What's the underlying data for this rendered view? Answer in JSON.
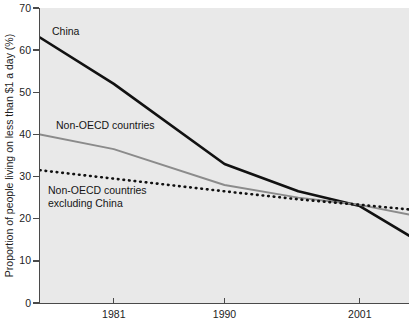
{
  "chart_data": {
    "type": "line",
    "title": "",
    "subtitle": "",
    "xlabel": "",
    "ylabel": "Proportion of people living on less than $1 a day (%)",
    "xlim": [
      1975,
      2005
    ],
    "ylim": [
      0,
      70
    ],
    "grid": false,
    "legend_position": "inline-annotations",
    "x_ticks": [
      1981,
      1990,
      2001
    ],
    "x_tick_labels": [
      "1981",
      "1990",
      "2001"
    ],
    "y_ticks": [
      0,
      10,
      20,
      30,
      40,
      50,
      60,
      70
    ],
    "y_tick_labels": [
      "0",
      "10",
      "20",
      "30",
      "40",
      "50",
      "60",
      "70"
    ],
    "series": [
      {
        "name": "China",
        "label": "China",
        "style": "solid",
        "color": "#111111",
        "width": 2.6,
        "x": [
          1975,
          1981,
          1990,
          1996,
          2001,
          2005
        ],
        "values": [
          63.0,
          52.0,
          33.0,
          26.5,
          23.0,
          16.0
        ]
      },
      {
        "name": "Non-OECD countries",
        "label": "Non-OECD countries",
        "style": "solid",
        "color": "#8b8b8b",
        "width": 1.9,
        "x": [
          1975,
          1981,
          1990,
          1996,
          2001,
          2005
        ],
        "values": [
          40.0,
          36.5,
          28.0,
          25.0,
          23.3,
          21.0
        ]
      },
      {
        "name": "Non-OECD countries excluding China",
        "label": "Non-OECD countries\nexcluding China",
        "style": "dotted",
        "color": "#111111",
        "width": 2.6,
        "x": [
          1975,
          1981,
          1990,
          1996,
          2001,
          2005
        ],
        "values": [
          31.5,
          29.5,
          26.5,
          24.6,
          23.3,
          22.2
        ]
      }
    ],
    "annotations": [
      {
        "text": "China",
        "x": 1977.0,
        "y": 66.0
      },
      {
        "text": "Non-OECD countries",
        "x": 1977.4,
        "y": 42.0
      },
      {
        "text": "Non-OECD countries\nexcluding China",
        "x": 1976.7,
        "y": 27.5
      }
    ],
    "colors": {
      "plot_background": "#e9e9e9",
      "figure_background": "#ffffff",
      "axis": "#4a4a4a",
      "text": "#1d1d1d",
      "china_line": "#111111",
      "nonoecd_line": "#8b8b8b",
      "nonoecd_excluding_china_line": "#111111"
    }
  }
}
